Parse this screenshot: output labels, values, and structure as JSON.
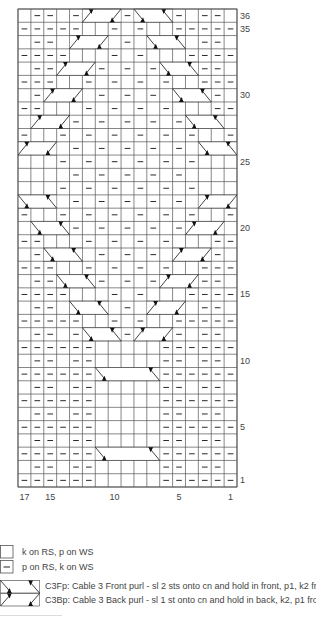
{
  "chart": {
    "columns": 17,
    "rows_count": 36,
    "legend_symbols": {
      ".": "knit",
      "-": "purl"
    },
    "colors": {
      "grid": "#555555",
      "ink": "#111111",
      "background": "#ffffff"
    },
    "rows": {
      "1": "------.....------",
      "2": ".--.--.....--.--.",
      "3": "------.....------",
      "4": ".--.--.....--.--.",
      "5": "------.....------",
      "6": ".--.--.....--.--.",
      "7": "------.....------",
      "8": ".--.--.....--.--.",
      "9": "------.....------",
      "10": ".--.--.....--.--.",
      "11": "------.....------",
      "12": ".--.-...-...-.--.",
      "13": "-----..-.-..-----",
      "14": ".--.....-.....--.",
      "15": "----...-.-...----",
      "16": ".--...-.-.-...--.",
      "17": "---..-.-.-.-..---",
      "18": ".-....-.-.-....-.",
      "19": "--...-.-.-.-...--",
      "20": "....-.-.-.-.-....",
      "21": "-..-.-.-.-.-.-..-",
      "22": "....-.-.-.-.-....",
      "23": "...-.-.-.-.-.-...",
      "24": "....-.-.-.-.-....",
      "25": "...-.-.-.-.-.-...",
      "26": "....-.-.-.-.-....",
      "27": "-..-.-.-.-.-.-..-",
      "28": "....-.-.-.-.-....",
      "29": "--...-.-.-.-...--",
      "30": ".-....-.-.-....-.",
      "31": "---..-.-.-.-..---",
      "32": ".--...-.-.-...--.",
      "33": "----...-.-...----",
      "34": ".--.....-.....--.",
      "35": "-----..-.-..-----",
      "36": ".--.-...-...-.--."
    },
    "cables": [
      {
        "row": 3,
        "start_col": 6,
        "span": 5,
        "type": "C3Fp"
      },
      {
        "row": 9,
        "start_col": 6,
        "span": 5,
        "type": "C3Fp"
      },
      {
        "row": 12,
        "start_col": 5,
        "span": 3,
        "type": "C3Fp"
      },
      {
        "row": 12,
        "start_col": 9,
        "span": 3,
        "type": "C3Bp"
      },
      {
        "row": 14,
        "start_col": 4,
        "span": 3,
        "type": "C3Fp"
      },
      {
        "row": 14,
        "start_col": 10,
        "span": 3,
        "type": "C3Bp"
      },
      {
        "row": 16,
        "start_col": 3,
        "span": 3,
        "type": "C3Fp"
      },
      {
        "row": 16,
        "start_col": 11,
        "span": 3,
        "type": "C3Bp"
      },
      {
        "row": 18,
        "start_col": 2,
        "span": 3,
        "type": "C3Fp"
      },
      {
        "row": 18,
        "start_col": 12,
        "span": 3,
        "type": "C3Bp"
      },
      {
        "row": 20,
        "start_col": 1,
        "span": 3,
        "type": "C3Fp"
      },
      {
        "row": 20,
        "start_col": 13,
        "span": 3,
        "type": "C3Bp"
      },
      {
        "row": 22,
        "start_col": 0,
        "span": 3,
        "type": "C3Fp"
      },
      {
        "row": 22,
        "start_col": 14,
        "span": 3,
        "type": "C3Bp"
      },
      {
        "row": 26,
        "start_col": 0,
        "span": 3,
        "type": "C3Bp"
      },
      {
        "row": 26,
        "start_col": 14,
        "span": 3,
        "type": "C3Fp"
      },
      {
        "row": 28,
        "start_col": 1,
        "span": 3,
        "type": "C3Bp"
      },
      {
        "row": 28,
        "start_col": 13,
        "span": 3,
        "type": "C3Fp"
      },
      {
        "row": 30,
        "start_col": 2,
        "span": 3,
        "type": "C3Bp"
      },
      {
        "row": 30,
        "start_col": 12,
        "span": 3,
        "type": "C3Fp"
      },
      {
        "row": 32,
        "start_col": 3,
        "span": 3,
        "type": "C3Bp"
      },
      {
        "row": 32,
        "start_col": 11,
        "span": 3,
        "type": "C3Fp"
      },
      {
        "row": 34,
        "start_col": 4,
        "span": 3,
        "type": "C3Bp"
      },
      {
        "row": 34,
        "start_col": 10,
        "span": 3,
        "type": "C3Fp"
      },
      {
        "row": 36,
        "start_col": 5,
        "span": 3,
        "type": "C3Bp"
      },
      {
        "row": 36,
        "start_col": 9,
        "span": 3,
        "type": "C3Fp"
      }
    ],
    "row_labels": [
      {
        "row": 36,
        "text": "36"
      },
      {
        "row": 35,
        "text": "35"
      },
      {
        "row": 30,
        "text": "30"
      },
      {
        "row": 25,
        "text": "25"
      },
      {
        "row": 20,
        "text": "20"
      },
      {
        "row": 15,
        "text": "15"
      },
      {
        "row": 10,
        "text": "10"
      },
      {
        "row": 5,
        "text": "5"
      },
      {
        "row": 1,
        "text": "1"
      }
    ],
    "col_labels": [
      {
        "stitch": 17,
        "text": "17"
      },
      {
        "stitch": 15,
        "text": "15"
      },
      {
        "stitch": 10,
        "text": "10"
      },
      {
        "stitch": 5,
        "text": "5"
      },
      {
        "stitch": 1,
        "text": "1"
      }
    ]
  },
  "key": {
    "knit": {
      "symbol": "empty-square",
      "text": "k on RS, p on WS"
    },
    "purl": {
      "symbol": "dash-square",
      "text": "p on RS, k on WS"
    },
    "c3fp": {
      "symbol": "C3Fp",
      "text": "C3Fp: Cable 3 Front purl - sl 2 sts onto cn and hold in front, p1, k2 from cn"
    },
    "c3bp": {
      "symbol": "C3Bp",
      "text": "C3Bp: Cable 3 Back purl - sl 1 st onto cn and hold in back, k2, p1 from cn"
    }
  }
}
